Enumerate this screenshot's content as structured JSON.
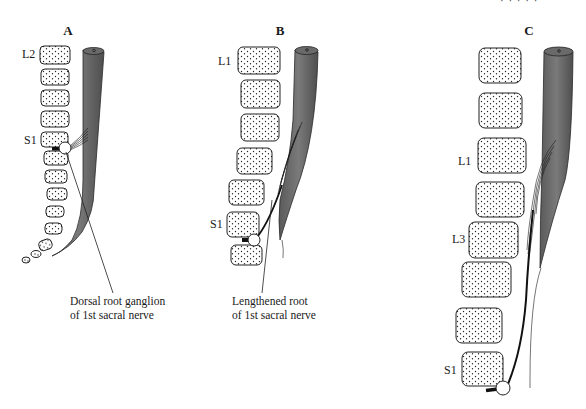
{
  "figure": {
    "header_fragment": "· · · · ·",
    "panels": [
      {
        "id": "A",
        "label": "A",
        "vertebra_labels": [
          {
            "text": "L2",
            "level": "top"
          },
          {
            "text": "S1",
            "level": "sacral"
          }
        ],
        "caption_lines": [
          "Dorsal root ganglion",
          "of 1st sacral nerve"
        ]
      },
      {
        "id": "B",
        "label": "B",
        "vertebra_labels": [
          {
            "text": "L1",
            "level": "top"
          },
          {
            "text": "S1",
            "level": "sacral"
          }
        ],
        "caption_lines": [
          "Lengthened root",
          "of 1st sacral nerve"
        ]
      },
      {
        "id": "C",
        "label": "C",
        "vertebra_labels": [
          {
            "text": "L1",
            "level": "upper-lumbar"
          },
          {
            "text": "L3",
            "level": "mid-lumbar"
          },
          {
            "text": "S1",
            "level": "sacral"
          }
        ],
        "caption_lines": []
      }
    ],
    "colors": {
      "spinal_cord": "#6e6e6e",
      "spinal_cord_dark": "#4a4a4a",
      "outline": "#222222",
      "background": "#ffffff"
    }
  }
}
